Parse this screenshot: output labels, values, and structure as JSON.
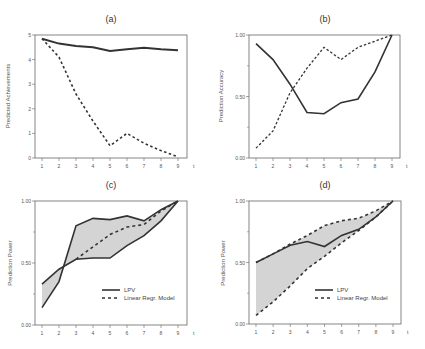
{
  "chart_data": [
    {
      "id": "a",
      "type": "line",
      "title": "(a)",
      "xlabel": "t",
      "ylabel": "Predicted Achievements",
      "x": [
        1,
        2,
        3,
        4,
        5,
        6,
        7,
        8,
        9
      ],
      "ylim": [
        0,
        5
      ],
      "yticks": [
        0,
        1,
        2,
        3,
        4,
        5
      ],
      "ytick_labels": [
        "0",
        "1",
        "2",
        "3",
        "4",
        "5"
      ],
      "series": [
        {
          "name": "solid",
          "style": "solid",
          "values": [
            4.85,
            4.65,
            4.55,
            4.5,
            4.35,
            4.42,
            4.48,
            4.42,
            4.38
          ]
        },
        {
          "name": "dashed",
          "style": "dashed",
          "values": [
            4.85,
            4.1,
            2.6,
            1.5,
            0.5,
            1.0,
            0.6,
            0.3,
            0.05
          ]
        }
      ],
      "legend": null,
      "grid": false
    },
    {
      "id": "b",
      "type": "line",
      "title": "(b)",
      "xlabel": "t",
      "ylabel": "Prediction Accuracy",
      "x": [
        1,
        2,
        3,
        4,
        5,
        6,
        7,
        8,
        9
      ],
      "ylim": [
        0,
        1
      ],
      "yticks": [
        0,
        0.5,
        1
      ],
      "ytick_labels": [
        "0.00",
        "0.50",
        "1.00"
      ],
      "series": [
        {
          "name": "solid",
          "style": "solid",
          "values": [
            0.93,
            0.8,
            0.6,
            0.37,
            0.36,
            0.45,
            0.48,
            0.7,
            1.0
          ]
        },
        {
          "name": "dashed",
          "style": "dashed",
          "values": [
            0.08,
            0.22,
            0.53,
            0.73,
            0.9,
            0.8,
            0.9,
            0.95,
            1.0
          ]
        }
      ],
      "legend": null,
      "grid": false
    },
    {
      "id": "c",
      "type": "line",
      "title": "(c)",
      "xlabel": "t",
      "ylabel": "Prediction Power",
      "x": [
        1,
        2,
        3,
        4,
        5,
        6,
        7,
        8,
        9
      ],
      "ylim": [
        0,
        1
      ],
      "yticks": [
        0,
        0.5,
        1
      ],
      "ytick_labels": [
        "0.00",
        "0.50",
        "1.00"
      ],
      "series": [
        {
          "name": "LPV upper",
          "style": "solid",
          "values": [
            0.14,
            0.35,
            0.8,
            0.86,
            0.85,
            0.88,
            0.84,
            0.93,
            1.0
          ]
        },
        {
          "name": "LPV lower",
          "style": "solid",
          "values": [
            0.33,
            0.45,
            0.53,
            0.54,
            0.54,
            0.64,
            0.72,
            0.84,
            1.0
          ]
        },
        {
          "name": "Linear Regr. Model",
          "style": "dashed",
          "values": [
            null,
            null,
            0.53,
            0.63,
            0.73,
            0.79,
            0.81,
            0.92,
            1.0
          ]
        }
      ],
      "legend": {
        "position": "lower right",
        "entries": [
          "LPV",
          "Linear Regr. Model"
        ]
      },
      "shaded_band": true,
      "grid": false
    },
    {
      "id": "d",
      "type": "line",
      "title": "(d)",
      "xlabel": "t",
      "ylabel": "Prediction Power",
      "x": [
        1,
        2,
        3,
        4,
        5,
        6,
        7,
        8,
        9
      ],
      "ylim": [
        0,
        1
      ],
      "yticks": [
        0,
        0.5,
        1
      ],
      "ytick_labels": [
        "0.00",
        "0.50",
        "1.00"
      ],
      "series": [
        {
          "name": "LPV",
          "style": "solid",
          "values": [
            0.5,
            0.57,
            0.64,
            0.67,
            0.63,
            0.72,
            0.77,
            0.87,
            1.0
          ]
        },
        {
          "name": "Linear Regr. upper",
          "style": "dashed",
          "values": [
            0.5,
            0.57,
            0.65,
            0.72,
            0.8,
            0.84,
            0.86,
            0.92,
            1.0
          ]
        },
        {
          "name": "Linear Regr. lower",
          "style": "dashed",
          "values": [
            0.07,
            0.18,
            0.31,
            0.45,
            0.55,
            0.66,
            0.76,
            0.87,
            1.0
          ]
        }
      ],
      "legend": {
        "position": "lower right",
        "entries": [
          "LPV",
          "Linear Regr. Model"
        ]
      },
      "shaded_band": true,
      "grid": false
    }
  ],
  "panels": {
    "a": {
      "title": "(a)",
      "ylabel": "Predicted Achievements",
      "xlabel": "t",
      "xticks": [
        "1",
        "2",
        "3",
        "4",
        "5",
        "6",
        "7",
        "8",
        "9"
      ],
      "yticks": [
        "0",
        "1",
        "2",
        "3",
        "4",
        "5"
      ]
    },
    "b": {
      "title": "(b)",
      "ylabel": "Prediction Accuracy",
      "xlabel": "t",
      "xticks": [
        "1",
        "2",
        "3",
        "4",
        "5",
        "6",
        "7",
        "8",
        "9"
      ],
      "yticks": [
        "0.00",
        "0.50",
        "1.00"
      ]
    },
    "c": {
      "title": "(c)",
      "ylabel": "Prediction Power",
      "xlabel": "t",
      "xticks": [
        "1",
        "2",
        "3",
        "4",
        "5",
        "6",
        "7",
        "8",
        "9"
      ],
      "yticks": [
        "0.00",
        "0.50",
        "1.00"
      ],
      "legend": [
        "LPV",
        "Linear Regr. Model"
      ]
    },
    "d": {
      "title": "(d)",
      "ylabel": "Prediction Power",
      "xlabel": "t",
      "xticks": [
        "1",
        "2",
        "3",
        "4",
        "5",
        "6",
        "7",
        "8",
        "9"
      ],
      "yticks": [
        "0.00",
        "0.50",
        "1.00"
      ],
      "legend": [
        "LPV",
        "Linear Regr. Model"
      ]
    }
  }
}
